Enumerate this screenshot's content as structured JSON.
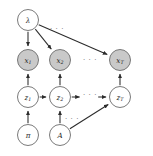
{
  "diagram": {
    "type": "directed-graphical-model",
    "background_color": "#ffffff",
    "shaded_node_color": "#c9c9c9",
    "open_node_color": "#ffffff",
    "node_stroke_color": "#6b6b6b",
    "edge_color": "#2b2b2b",
    "ellipsis_color": "#7a7a7a",
    "nodes": [
      {
        "id": "lambda",
        "base": "λ",
        "sub": "",
        "x": 28,
        "y": 20,
        "r": 10.5,
        "shaded": false
      },
      {
        "id": "x1",
        "base": "x",
        "sub": "1",
        "x": 28,
        "y": 60,
        "r": 10.5,
        "shaded": true
      },
      {
        "id": "x2",
        "base": "x",
        "sub": "2",
        "x": 60,
        "y": 60,
        "r": 10.5,
        "shaded": true
      },
      {
        "id": "xT",
        "base": "x",
        "sub": "T",
        "x": 120,
        "y": 60,
        "r": 10.5,
        "shaded": true
      },
      {
        "id": "z1",
        "base": "z",
        "sub": "1",
        "x": 28,
        "y": 97,
        "r": 10.5,
        "shaded": false
      },
      {
        "id": "z2",
        "base": "z",
        "sub": "2",
        "x": 60,
        "y": 97,
        "r": 10.5,
        "shaded": false
      },
      {
        "id": "zT",
        "base": "z",
        "sub": "T",
        "x": 120,
        "y": 97,
        "r": 10.5,
        "shaded": false
      },
      {
        "id": "pi",
        "base": "π",
        "sub": "",
        "x": 28,
        "y": 135,
        "r": 10.5,
        "shaded": false
      },
      {
        "id": "A",
        "base": "A",
        "sub": "",
        "x": 60,
        "y": 135,
        "r": 10.5,
        "shaded": false
      }
    ],
    "edges": [
      {
        "id": "lambda-x1",
        "from": "lambda",
        "to": "x1"
      },
      {
        "id": "lambda-x2",
        "from": "lambda",
        "to": "x2"
      },
      {
        "id": "lambda-xT",
        "from": "lambda",
        "to": "xT"
      },
      {
        "id": "z1-x1",
        "from": "z1",
        "to": "x1"
      },
      {
        "id": "z2-x2",
        "from": "z2",
        "to": "x2"
      },
      {
        "id": "zT-xT",
        "from": "zT",
        "to": "xT"
      },
      {
        "id": "z1-z2",
        "from": "z1",
        "to": "z2"
      },
      {
        "id": "z2-dots",
        "from": "z2",
        "to": "dots-z"
      },
      {
        "id": "dots-zT",
        "from": "dots-z",
        "to": "zT"
      },
      {
        "id": "pi-z1",
        "from": "pi",
        "to": "z1"
      },
      {
        "id": "A-z2",
        "from": "A",
        "to": "z2"
      },
      {
        "id": "A-zT",
        "from": "A",
        "to": "zT"
      }
    ],
    "ellipses": [
      {
        "id": "dots-top",
        "label": "· · ·",
        "x": 57,
        "y": 29
      },
      {
        "id": "dots-x-row",
        "label": "· · ·",
        "x": 90,
        "y": 60
      },
      {
        "id": "dots-z-row",
        "label": "· · ·",
        "x": 90,
        "y": 95
      },
      {
        "id": "dots-bottom",
        "label": "· · ·",
        "x": 72,
        "y": 119
      }
    ]
  }
}
